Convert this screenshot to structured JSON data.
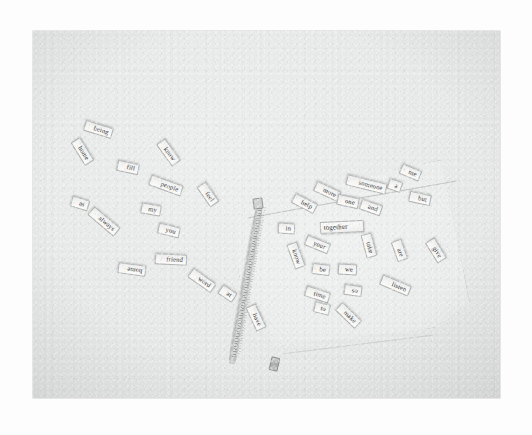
{
  "scene": {
    "kind": "photograph",
    "subject": "word-tiles-and-zipper-pouch",
    "surface_color": "#e7e9e8",
    "print_border_color": "#ffffff",
    "tile_color": "#f6f6f5",
    "tile_text_color": "#2a2b2b",
    "pouch_color": "#eaecec",
    "zipper_color": "#b9bbba"
  },
  "tiles": [
    {
      "word": "being",
      "x": 84,
      "y": 124,
      "w": 29,
      "h": 11,
      "rot": -163,
      "size": 6.6,
      "flip": true
    },
    {
      "word": "home",
      "x": 69,
      "y": 146,
      "w": 27,
      "h": 11,
      "rot": -122,
      "size": 6.6,
      "flip": true
    },
    {
      "word": "fill",
      "x": 117,
      "y": 162,
      "w": 22,
      "h": 11,
      "rot": -168,
      "size": 6.6,
      "flip": true
    },
    {
      "word": "know",
      "x": 155,
      "y": 147,
      "w": 27,
      "h": 11,
      "rot": -126,
      "size": 6.6,
      "flip": true
    },
    {
      "word": "people",
      "x": 149,
      "y": 180,
      "w": 34,
      "h": 11,
      "rot": -160,
      "size": 6.6,
      "flip": true
    },
    {
      "word": "feel",
      "x": 196,
      "y": 189,
      "w": 24,
      "h": 11,
      "rot": -125,
      "size": 6.6,
      "flip": true
    },
    {
      "word": "as",
      "x": 71,
      "y": 198,
      "w": 18,
      "h": 11,
      "rot": -163,
      "size": 6.6,
      "flip": true
    },
    {
      "word": "my",
      "x": 141,
      "y": 204,
      "w": 20,
      "h": 11,
      "rot": -170,
      "size": 6.6,
      "flip": true
    },
    {
      "word": "always",
      "x": 87,
      "y": 216,
      "w": 34,
      "h": 11,
      "rot": -140,
      "size": 6.6,
      "flip": true
    },
    {
      "word": "you",
      "x": 158,
      "y": 225,
      "w": 22,
      "h": 11,
      "rot": -166,
      "size": 6.6,
      "flip": true
    },
    {
      "word": "friend",
      "x": 155,
      "y": 254,
      "w": 32,
      "h": 11,
      "rot": -177,
      "size": 6.6,
      "flip": true
    },
    {
      "word": "home",
      "x": 118,
      "y": 264,
      "w": 28,
      "h": 11,
      "rot": -172,
      "size": 6.6,
      "flip": false
    },
    {
      "word": "word",
      "x": 188,
      "y": 275,
      "w": 28,
      "h": 11,
      "rot": -145,
      "size": 6.6,
      "flip": true
    },
    {
      "word": "at",
      "x": 219,
      "y": 288,
      "w": 17,
      "h": 11,
      "rot": -146,
      "size": 6.6,
      "flip": true
    },
    {
      "word": "have",
      "x": 243,
      "y": 312,
      "w": 26,
      "h": 11,
      "rot": -115,
      "size": 6.6,
      "flip": true
    },
    {
      "word": "more",
      "x": 314,
      "y": 186,
      "w": 27,
      "h": 11,
      "rot": -155,
      "size": 6.6,
      "flip": true
    },
    {
      "word": "someone",
      "x": 346,
      "y": 179,
      "w": 41,
      "h": 11,
      "rot": -166,
      "size": 6.6,
      "flip": true
    },
    {
      "word": "a",
      "x": 388,
      "y": 180,
      "w": 14,
      "h": 11,
      "rot": -160,
      "size": 6.6,
      "flip": true
    },
    {
      "word": "me",
      "x": 400,
      "y": 167,
      "w": 21,
      "h": 11,
      "rot": -157,
      "size": 6.6,
      "flip": true
    },
    {
      "word": "help",
      "x": 292,
      "y": 198,
      "w": 25,
      "h": 11,
      "rot": -153,
      "size": 6.6,
      "flip": true
    },
    {
      "word": "one",
      "x": 337,
      "y": 196,
      "w": 22,
      "h": 11,
      "rot": -168,
      "size": 6.6,
      "flip": true
    },
    {
      "word": "and",
      "x": 360,
      "y": 202,
      "w": 22,
      "h": 11,
      "rot": -161,
      "size": 6.6,
      "flip": true
    },
    {
      "word": "but",
      "x": 409,
      "y": 193,
      "w": 22,
      "h": 11,
      "rot": -168,
      "size": 6.6,
      "flip": true
    },
    {
      "word": "in",
      "x": 278,
      "y": 223,
      "w": 17,
      "h": 11,
      "rot": -177,
      "size": 6.6,
      "flip": true
    },
    {
      "word": "together",
      "x": 320,
      "y": 221,
      "w": 44,
      "h": 12,
      "rot": -3,
      "size": 7.0,
      "flip": false
    },
    {
      "word": "your",
      "x": 305,
      "y": 239,
      "w": 25,
      "h": 11,
      "rot": -158,
      "size": 6.6,
      "flip": true
    },
    {
      "word": "take",
      "x": 357,
      "y": 240,
      "w": 24,
      "h": 11,
      "rot": -105,
      "size": 6.6,
      "flip": true
    },
    {
      "word": "are",
      "x": 389,
      "y": 245,
      "w": 21,
      "h": 11,
      "rot": -110,
      "size": 6.6,
      "flip": true
    },
    {
      "word": "give",
      "x": 424,
      "y": 245,
      "w": 24,
      "h": 11,
      "rot": -122,
      "size": 6.6,
      "flip": true
    },
    {
      "word": "know",
      "x": 283,
      "y": 250,
      "w": 26,
      "h": 11,
      "rot": -110,
      "size": 6.6,
      "flip": true
    },
    {
      "word": "be",
      "x": 312,
      "y": 264,
      "w": 18,
      "h": 11,
      "rot": -173,
      "size": 6.6,
      "flip": true
    },
    {
      "word": "we",
      "x": 338,
      "y": 264,
      "w": 19,
      "h": 11,
      "rot": -177,
      "size": 6.6,
      "flip": true
    },
    {
      "word": "time",
      "x": 305,
      "y": 289,
      "w": 25,
      "h": 11,
      "rot": -162,
      "size": 6.6,
      "flip": true
    },
    {
      "word": "so",
      "x": 344,
      "y": 285,
      "w": 18,
      "h": 11,
      "rot": -172,
      "size": 6.6,
      "flip": true
    },
    {
      "word": "listen",
      "x": 380,
      "y": 280,
      "w": 31,
      "h": 11,
      "rot": -157,
      "size": 6.6,
      "flip": true
    },
    {
      "word": "to",
      "x": 314,
      "y": 303,
      "w": 16,
      "h": 11,
      "rot": -166,
      "size": 6.6,
      "flip": true
    },
    {
      "word": "make",
      "x": 335,
      "y": 310,
      "w": 27,
      "h": 11,
      "rot": -136,
      "size": 6.6,
      "flip": true
    }
  ]
}
